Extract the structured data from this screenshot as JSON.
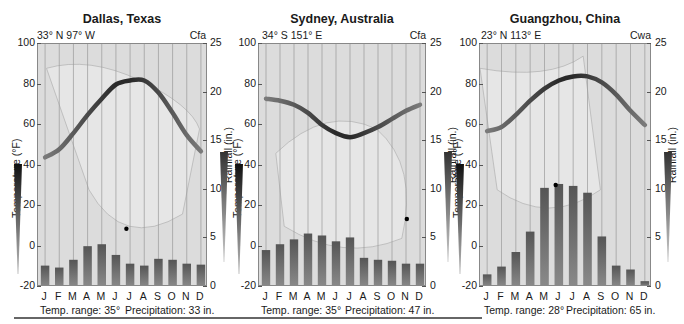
{
  "chart_data": [
    {
      "type": "bar+line",
      "title": "Dallas, Texas",
      "location": "33° N  97° W",
      "climate_code": "Cfa",
      "xlabel": "",
      "ylabel_left": "Temperature (°F)",
      "ylabel_right": "Rainfall (in.)",
      "ylim_left": [
        -20,
        100
      ],
      "ylim_right": [
        0,
        25
      ],
      "yticks_left": [
        "100",
        "80",
        "60",
        "40",
        "20",
        "0",
        "-20"
      ],
      "yticks_right": [
        "25",
        "20",
        "15",
        "10",
        "5",
        "0"
      ],
      "categories": [
        "J",
        "F",
        "M",
        "A",
        "M",
        "J",
        "J",
        "A",
        "S",
        "O",
        "N",
        "D"
      ],
      "series": [
        {
          "name": "Temperature (°F)",
          "type": "line",
          "values": [
            44,
            48,
            56,
            65,
            73,
            80,
            82,
            82,
            76,
            66,
            55,
            47
          ]
        },
        {
          "name": "Rainfall (in.)",
          "type": "bar",
          "values": [
            2.2,
            2.0,
            2.8,
            4.2,
            4.4,
            3.3,
            2.4,
            2.2,
            2.9,
            2.8,
            2.4,
            2.3
          ]
        }
      ],
      "summary": {
        "temp_range": "Temp. range: 35°",
        "precipitation": "Precipitation: 33 in."
      }
    },
    {
      "type": "bar+line",
      "title": "Sydney, Australia",
      "location": "34° S  151° E",
      "climate_code": "Cfa",
      "xlabel": "",
      "ylabel_left": "Temperature (°F)",
      "ylabel_right": "Rainfall (in.)",
      "ylim_left": [
        -20,
        100
      ],
      "ylim_right": [
        0,
        25
      ],
      "yticks_left": [
        "100",
        "80",
        "60",
        "40",
        "20",
        "0",
        "-20"
      ],
      "yticks_right": [
        "25",
        "20",
        "15",
        "10",
        "5",
        "0"
      ],
      "categories": [
        "J",
        "F",
        "M",
        "A",
        "M",
        "J",
        "J",
        "A",
        "S",
        "O",
        "N",
        "D"
      ],
      "series": [
        {
          "name": "Temperature (°F)",
          "type": "line",
          "values": [
            73,
            72,
            70,
            66,
            60,
            56,
            54,
            56,
            59,
            63,
            67,
            70
          ]
        },
        {
          "name": "Rainfall (in.)",
          "type": "bar",
          "values": [
            3.8,
            4.4,
            4.9,
            5.5,
            5.3,
            4.7,
            5.1,
            3.0,
            2.8,
            2.7,
            2.4,
            2.4
          ]
        }
      ],
      "summary": {
        "temp_range": "Temp. range: 35°",
        "precipitation": "Precipitation: 47 in."
      }
    },
    {
      "type": "bar+line",
      "title": "Guangzhou, China",
      "location": "23° N  113° E",
      "climate_code": "Cwa",
      "xlabel": "",
      "ylabel_left": "Temperature (°F)",
      "ylabel_right": "Rainfall (in.)",
      "ylim_left": [
        -20,
        100
      ],
      "ylim_right": [
        0,
        25
      ],
      "yticks_left": [
        "100",
        "80",
        "60",
        "40",
        "20",
        "0",
        "-20"
      ],
      "yticks_right": [
        "25",
        "20",
        "15",
        "10",
        "5",
        "0"
      ],
      "categories": [
        "J",
        "F",
        "M",
        "A",
        "M",
        "J",
        "J",
        "A",
        "S",
        "O",
        "N",
        "D"
      ],
      "series": [
        {
          "name": "Temperature (°F)",
          "type": "line",
          "values": [
            57,
            59,
            65,
            72,
            78,
            82,
            84,
            84,
            81,
            75,
            67,
            60
          ]
        },
        {
          "name": "Rainfall (in.)",
          "type": "bar",
          "values": [
            1.3,
            2.1,
            3.6,
            5.7,
            10.2,
            10.6,
            10.4,
            9.7,
            5.2,
            2.2,
            1.8,
            0.6
          ]
        }
      ],
      "summary": {
        "temp_range": "Temp. range: 28°",
        "precipitation": "Precipitation: 65 in."
      }
    }
  ],
  "colors": {
    "plot_bg": "#dcdcdc",
    "bar": "#6b6b6b",
    "line_dark": "#2a2a2a",
    "line_light": "#7a7a7a",
    "gridline": "#9a9a9a",
    "station_dot": "#000000"
  }
}
